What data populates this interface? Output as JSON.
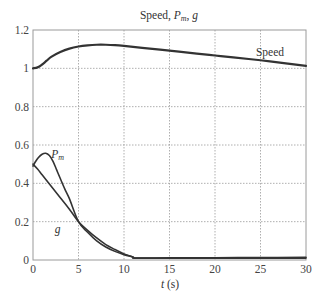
{
  "chart_data": {
    "type": "line",
    "title_parts": {
      "main": "Speed, ",
      "p": "P",
      "sub": "m",
      "comma": ", ",
      "g": "g"
    },
    "xlabel": "t (s)",
    "xlabel_parts": {
      "var": "t",
      "unit": " (s)"
    },
    "ylabel": "",
    "xlim": [
      0,
      30
    ],
    "ylim": [
      0,
      1.2
    ],
    "xticks": [
      0,
      5,
      10,
      15,
      20,
      25,
      30
    ],
    "yticks": [
      0,
      0.2,
      0.4,
      0.6,
      0.8,
      1,
      1.2
    ],
    "xtick_labels": [
      "0",
      "5",
      "10",
      "15",
      "20",
      "25",
      "30"
    ],
    "ytick_labels": [
      "0",
      "0.2",
      "0.4",
      "0.6",
      "0.8",
      "1",
      "1.2"
    ],
    "grid": true,
    "legend": "inline labels",
    "series": [
      {
        "name": "Speed",
        "label": "Speed",
        "label_pos": [
          24.5,
          1.065
        ],
        "x": [
          0,
          0.5,
          1,
          1.5,
          2,
          3,
          4,
          5,
          6,
          7,
          8,
          9,
          10,
          12,
          15,
          18,
          20,
          22,
          25,
          28,
          30
        ],
        "values": [
          1.0,
          1.005,
          1.02,
          1.04,
          1.06,
          1.085,
          1.103,
          1.114,
          1.12,
          1.123,
          1.123,
          1.121,
          1.117,
          1.107,
          1.092,
          1.077,
          1.067,
          1.057,
          1.042,
          1.025,
          1.013
        ]
      },
      {
        "name": "Pm",
        "label": "P_m",
        "label_parts": {
          "p": "P",
          "sub": "m"
        },
        "label_pos": [
          2.0,
          0.53
        ],
        "x": [
          0,
          0.3,
          0.6,
          1.0,
          1.4,
          1.8,
          2.2,
          2.6,
          3,
          3.5,
          4,
          5,
          6,
          7,
          8,
          9,
          10,
          11,
          11.3,
          15,
          20,
          25,
          30
        ],
        "values": [
          0.49,
          0.515,
          0.535,
          0.552,
          0.557,
          0.545,
          0.515,
          0.47,
          0.425,
          0.37,
          0.32,
          0.2,
          0.145,
          0.1,
          0.068,
          0.045,
          0.028,
          0.015,
          0.01,
          0.011,
          0.012,
          0.013,
          0.014
        ]
      },
      {
        "name": "g",
        "label": "g",
        "label_pos": [
          2.4,
          0.14
        ],
        "x": [
          0,
          0.5,
          1,
          2,
          3,
          4,
          5,
          6,
          7,
          8,
          9,
          10,
          11,
          11.3,
          15,
          20,
          25,
          30
        ],
        "values": [
          0.5,
          0.475,
          0.445,
          0.385,
          0.325,
          0.265,
          0.2,
          0.155,
          0.115,
          0.08,
          0.055,
          0.032,
          0.015,
          0.01,
          0.01,
          0.01,
          0.01,
          0.01
        ]
      }
    ]
  }
}
